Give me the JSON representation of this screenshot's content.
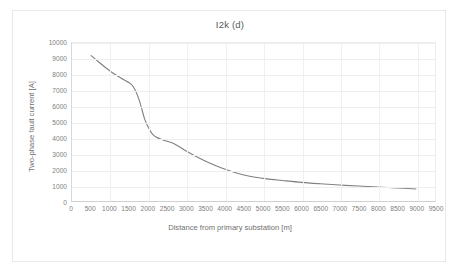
{
  "chart_data": {
    "type": "line",
    "title": "I2k (d)",
    "xlabel": "Distance from primary substation [m]",
    "ylabel": "Two-phase fault current [A]",
    "xlim": [
      0,
      9500
    ],
    "ylim": [
      0,
      10000
    ],
    "grid": true,
    "legend": "none",
    "line_color": "#808080",
    "xticks": [
      0,
      500,
      1000,
      1500,
      2000,
      2500,
      3000,
      3500,
      4000,
      4500,
      5000,
      5500,
      6000,
      6500,
      7000,
      7500,
      8000,
      8500,
      9000,
      9500
    ],
    "yticks": [
      0,
      1000,
      2000,
      3000,
      4000,
      5000,
      6000,
      7000,
      8000,
      9000,
      10000
    ],
    "series": [
      {
        "name": "I2k",
        "x": [
          500,
          700,
          900,
          1100,
          1300,
          1450,
          1600,
          1750,
          1900,
          2000,
          2100,
          2200,
          2400,
          2600,
          2800,
          3000,
          3300,
          3600,
          3900,
          4200,
          4500,
          4800,
          5100,
          5500,
          6000,
          6500,
          7000,
          7500,
          8000,
          8500,
          9000
        ],
        "y": [
          9200,
          8800,
          8400,
          8050,
          7750,
          7550,
          7250,
          6450,
          5200,
          4650,
          4250,
          4050,
          3850,
          3700,
          3450,
          3150,
          2750,
          2400,
          2100,
          1850,
          1650,
          1500,
          1400,
          1300,
          1180,
          1090,
          1010,
          950,
          890,
          830,
          760
        ]
      }
    ]
  },
  "axis": {
    "x_title": "Distance from primary substation [m]",
    "y_title": "Two-phase fault current [A]"
  }
}
